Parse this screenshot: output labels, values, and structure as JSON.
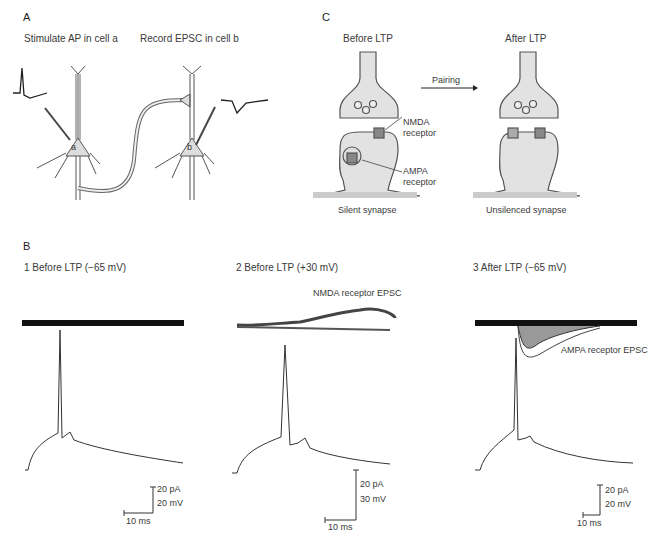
{
  "panel_a": {
    "letter": "A",
    "stim_label": "Stimulate AP in cell a",
    "record_label": "Record EPSC in cell b",
    "cell_a": "a",
    "cell_b": "b"
  },
  "panel_c": {
    "letter": "C",
    "before_title": "Before LTP",
    "after_title": "After LTP",
    "arrow_label": "Pairing",
    "nmda_label_1": "NMDA",
    "nmda_label_2": "receptor",
    "ampa_label_1": "AMPA",
    "ampa_label_2": "receptor",
    "before_caption": "Silent synapse",
    "after_caption": "Unsilenced synapse"
  },
  "panel_b": {
    "letter": "B",
    "traces": [
      {
        "title": "1  Before LTP (−65 mV)",
        "scale_current": "20 pA",
        "scale_voltage": "20 mV",
        "scale_time": "10 ms"
      },
      {
        "title": "2  Before LTP (+30 mV)",
        "annotation": "NMDA receptor EPSC",
        "scale_current": "20 pA",
        "scale_voltage": "30 mV",
        "scale_time": "10 ms"
      },
      {
        "title": "3  After LTP (−65 mV)",
        "annotation": "AMPA receptor EPSC",
        "scale_current": "20 pA",
        "scale_voltage": "20 mV",
        "scale_time": "10 ms"
      }
    ]
  }
}
